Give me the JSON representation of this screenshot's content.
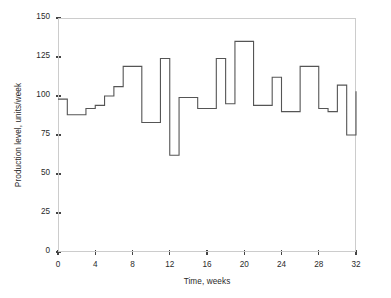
{
  "chart_data": {
    "type": "line",
    "subtype": "step-post",
    "title": "",
    "xlabel": "Time, weeks",
    "ylabel": "Production level, units/week",
    "xlim": [
      0,
      32
    ],
    "ylim": [
      0,
      150
    ],
    "xticks": [
      0,
      4,
      8,
      12,
      16,
      20,
      24,
      28,
      32
    ],
    "yticks": [
      0,
      25,
      50,
      75,
      100,
      125,
      150
    ],
    "grid": false,
    "legend": null,
    "series": [
      {
        "name": "Production level",
        "x": [
          0,
          1,
          2,
          3,
          4,
          5,
          6,
          7,
          8,
          9,
          10,
          11,
          12,
          13,
          14,
          15,
          16,
          17,
          18,
          19,
          20,
          21,
          22,
          23,
          24,
          25,
          26,
          27,
          28,
          29,
          30,
          31,
          32
        ],
        "values": [
          98,
          88,
          88,
          92,
          94,
          100,
          106,
          119,
          119,
          83,
          83,
          124,
          62,
          99,
          99,
          92,
          92,
          124,
          95,
          135,
          135,
          94,
          94,
          112,
          90,
          90,
          119,
          119,
          92,
          90,
          107,
          75,
          103
        ]
      }
    ],
    "colors": {
      "line": "#555555",
      "frame": "#cccccc",
      "tick": "#444444",
      "text": "#2a2a2a",
      "background": "#ffffff"
    }
  }
}
